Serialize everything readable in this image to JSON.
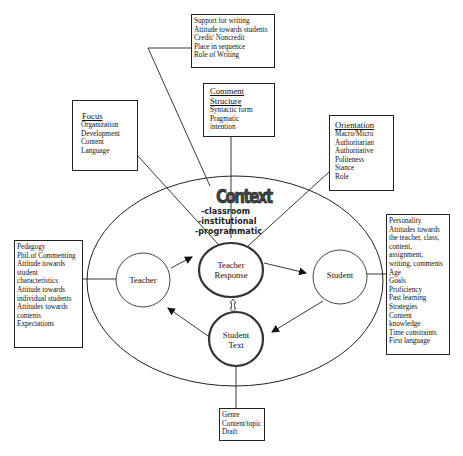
{
  "diagram": {
    "top_box": {
      "items": [
        "Support for writing",
        "Attitude towards students",
        "Credit/ Noncredit",
        "Place in sequence",
        "Role of Writing"
      ]
    },
    "comment_structure_box": {
      "title_line1": "Comment",
      "title_line2": "Structure",
      "items": [
        "Syntactic form",
        "Pragmatic",
        "intention"
      ]
    },
    "focus_box": {
      "title": "Focus",
      "items": [
        "Organization",
        "Development",
        "Content",
        "Language"
      ]
    },
    "orientation_box": {
      "title": "Orientation",
      "items": [
        "Macro/Micro",
        "Authoritarian",
        "Authoritative",
        "Politeness",
        "Stance",
        "Role"
      ]
    },
    "context": {
      "title": "Context",
      "items": [
        "-classroom",
        "-institutional",
        "-programmatic"
      ]
    },
    "teacher_box": {
      "items": [
        "Pedagogy",
        "Phil.of Commenting",
        "Attitude towards",
        "student",
        "characteristics",
        "Attitude towards",
        "individual students",
        "Attitudes towards",
        "contents",
        "Expectations"
      ]
    },
    "student_box": {
      "items": [
        "Personality",
        "Attitudes towards",
        "the teacher, class,",
        "content,",
        "assignment,",
        "writing, comments",
        "Age",
        "Goals",
        "Proficiency",
        "Past learning",
        "Strategies",
        "Content",
        "knowledge",
        "Time constraints",
        "First language"
      ]
    },
    "student_text_box": {
      "items": [
        "Genre",
        "Content/topic",
        "Draft"
      ]
    },
    "nodes": {
      "teacher": "Teacher",
      "teacher_response_line1": "Teacher",
      "teacher_response_line2": "Response",
      "student": "Student",
      "student_text_line1": "Student",
      "student_text_line2": "Text"
    }
  }
}
